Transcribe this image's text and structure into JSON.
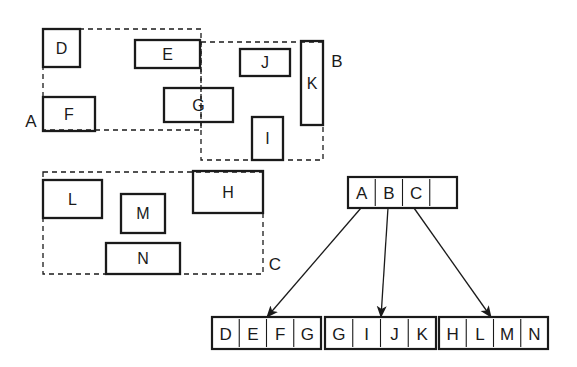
{
  "diagram": {
    "type": "r-tree",
    "colors": {
      "stroke": "#1a1a1a",
      "background": "#ffffff"
    },
    "groups": [
      {
        "id": "A",
        "label": "A",
        "x": 43,
        "y": 29,
        "w": 158,
        "h": 101,
        "label_x": 31,
        "label_y": 121
      },
      {
        "id": "B",
        "label": "B",
        "x": 201,
        "y": 42,
        "w": 122,
        "h": 118,
        "label_x": 337,
        "label_y": 61
      },
      {
        "id": "C",
        "label": "C",
        "x": 43,
        "y": 172,
        "w": 220,
        "h": 102,
        "label_x": 275,
        "label_y": 264
      }
    ],
    "rectangles": [
      {
        "id": "D",
        "label": "D",
        "x": 43,
        "y": 29,
        "w": 37,
        "h": 38
      },
      {
        "id": "E",
        "label": "E",
        "x": 135,
        "y": 40,
        "w": 65,
        "h": 28
      },
      {
        "id": "F",
        "label": "F",
        "x": 43,
        "y": 97,
        "w": 52,
        "h": 34
      },
      {
        "id": "G",
        "label": "G",
        "x": 164,
        "y": 88,
        "w": 69,
        "h": 34
      },
      {
        "id": "J",
        "label": "J",
        "x": 240,
        "y": 49,
        "w": 50,
        "h": 27
      },
      {
        "id": "K",
        "label": "K",
        "x": 301,
        "y": 41,
        "w": 22,
        "h": 84
      },
      {
        "id": "I",
        "label": "I",
        "x": 252,
        "y": 117,
        "w": 31,
        "h": 43
      },
      {
        "id": "L",
        "label": "L",
        "x": 43,
        "y": 180,
        "w": 59,
        "h": 38
      },
      {
        "id": "M",
        "label": "M",
        "x": 121,
        "y": 194,
        "w": 44,
        "h": 39
      },
      {
        "id": "N",
        "label": "N",
        "x": 106,
        "y": 243,
        "w": 74,
        "h": 31
      },
      {
        "id": "H",
        "label": "H",
        "x": 193,
        "y": 171,
        "w": 70,
        "h": 42
      }
    ],
    "root_node": {
      "x": 348,
      "y": 177,
      "cell_w": 27.25,
      "h": 31,
      "entries": [
        "A",
        "B",
        "C",
        ""
      ]
    },
    "leaf_nodes": [
      {
        "id": "leaf-A",
        "x": 212,
        "y": 317,
        "cell_w": 27.25,
        "h": 32,
        "entries": [
          "D",
          "E",
          "F",
          "G"
        ]
      },
      {
        "id": "leaf-B",
        "x": 325,
        "y": 317,
        "cell_w": 27.75,
        "h": 32,
        "entries": [
          "G",
          "I",
          "J",
          "K"
        ]
      },
      {
        "id": "leaf-C",
        "x": 439,
        "y": 317,
        "cell_w": 27.25,
        "h": 32,
        "entries": [
          "H",
          "L",
          "M",
          "N"
        ]
      }
    ],
    "arrows": [
      {
        "from": "A",
        "to": "leaf-A",
        "x1": 361,
        "y1": 208,
        "x2": 267,
        "y2": 317
      },
      {
        "from": "B",
        "to": "leaf-B",
        "x1": 388,
        "y1": 208,
        "x2": 381,
        "y2": 317
      },
      {
        "from": "C",
        "to": "leaf-C",
        "x1": 414,
        "y1": 208,
        "x2": 491,
        "y2": 317
      }
    ]
  }
}
